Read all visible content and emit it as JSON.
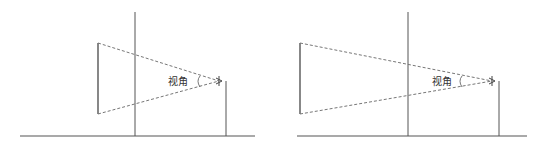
{
  "diagrams": [
    {
      "id": "left",
      "angle_label": "视角",
      "description": "Object closer to wall; smaller viewing angle"
    },
    {
      "id": "right",
      "angle_label": "视角",
      "description": "Object farther from wall; same viewing angle"
    }
  ],
  "colors": {
    "line": "#555555",
    "dash": "#777777",
    "background": "#ffffff"
  }
}
